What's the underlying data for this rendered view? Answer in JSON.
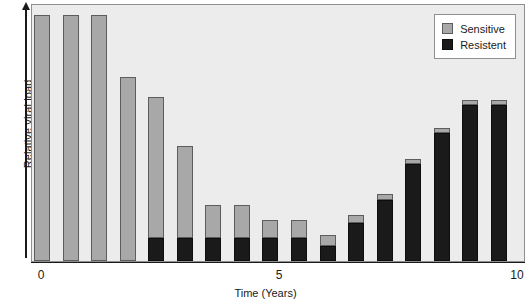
{
  "chart_data": {
    "type": "bar",
    "title": "",
    "subtitle": "",
    "xlabel": "Time (Years)",
    "ylabel": "Relative viral load",
    "stacked": true,
    "grid": false,
    "legend_position": "top-right",
    "xlim": [
      0,
      10
    ],
    "ylim": [
      0,
      100
    ],
    "xticks": [
      {
        "value": 0,
        "label": "0"
      },
      {
        "value": 5,
        "label": "5"
      },
      {
        "value": 10,
        "label": "10"
      }
    ],
    "yticks": [],
    "x": [
      0.0,
      0.6,
      1.2,
      1.8,
      2.4,
      3.0,
      3.6,
      4.2,
      4.8,
      5.4,
      6.0,
      6.6,
      7.2,
      7.8,
      8.4,
      9.0,
      9.6
    ],
    "categories": [
      "0.0",
      "0.6",
      "1.2",
      "1.8",
      "2.4",
      "3.0",
      "3.6",
      "4.2",
      "4.8",
      "5.4",
      "6.0",
      "6.6",
      "7.2",
      "7.8",
      "8.4",
      "9.0",
      "9.6"
    ],
    "series": [
      {
        "name": "Sensitive",
        "color": "#a8a8a8",
        "values": [
          96,
          96,
          96,
          72,
          55,
          36,
          13,
          13,
          7,
          7,
          4,
          3,
          2,
          2,
          2,
          2,
          2
        ]
      },
      {
        "name": "Resistent",
        "color": "#1a1a1a",
        "values": [
          0,
          0,
          0,
          0,
          9,
          9,
          9,
          9,
          9,
          9,
          6,
          15,
          24,
          38,
          50,
          61,
          61
        ]
      }
    ],
    "totals": [
      96,
      96,
      96,
      72,
      64,
      45,
      22,
      22,
      16,
      16,
      10,
      18,
      26,
      40,
      52,
      63,
      63
    ],
    "annotations": []
  },
  "legend": {
    "items": [
      {
        "label": "Sensitive",
        "color": "#a8a8a8"
      },
      {
        "label": "Resistent",
        "color": "#1a1a1a"
      }
    ]
  },
  "axes": {
    "y_label": "Relative viral load",
    "x_label": "Time (Years)",
    "x_tick_labels": [
      "0",
      "5",
      "10"
    ]
  }
}
